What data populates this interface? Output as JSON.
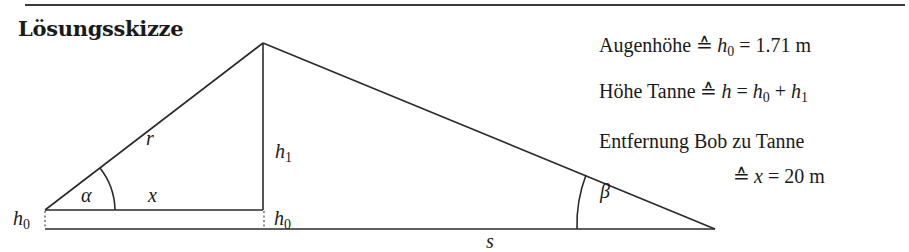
{
  "title": "Lösungsskizze",
  "sketch": {
    "labels": {
      "r": "r",
      "h1_var": "h",
      "h1_sub": "1",
      "alpha": "α",
      "x": "x",
      "h0_left_var": "h",
      "h0_left_sub": "0",
      "h0_right_var": "h",
      "h0_right_sub": "0",
      "beta": "β",
      "s": "s"
    }
  },
  "info": {
    "line1": {
      "text": "Augenhöhe",
      "corr": "≙",
      "var": "h",
      "sub": "0",
      "eq": "=",
      "value": "1.71 m"
    },
    "line2": {
      "text": "Höhe Tanne",
      "corr": "≙",
      "var": "h",
      "eq": "=",
      "rhs_var1": "h",
      "rhs_sub1": "0",
      "plus": "+",
      "rhs_var2": "h",
      "rhs_sub2": "1"
    },
    "line3": {
      "text": "Entfernung Bob zu Tanne"
    },
    "line4": {
      "corr": "≙",
      "var": "x",
      "eq": "=",
      "value": "20 m"
    }
  }
}
